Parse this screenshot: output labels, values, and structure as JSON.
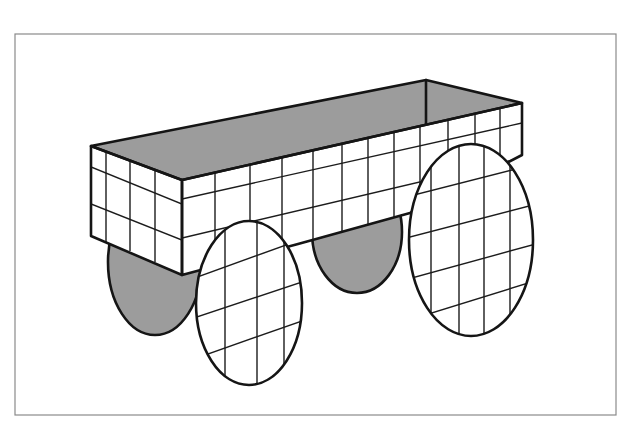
{
  "figure": {
    "canvas": {
      "width": 629,
      "height": 430
    },
    "frame": {
      "x": 15,
      "y": 34,
      "w": 601,
      "h": 381,
      "stroke": "#8a8a8a"
    },
    "colors": {
      "fill_gray": "#9c9c9c",
      "fill_white": "#ffffff",
      "line": "#151515"
    },
    "box": {
      "top_face": [
        [
          91,
          146
        ],
        [
          426,
          80
        ],
        [
          522,
          103
        ],
        [
          182,
          180
        ]
      ],
      "left_face": [
        [
          91,
          146
        ],
        [
          182,
          180
        ],
        [
          182,
          275
        ],
        [
          91,
          236
        ]
      ],
      "front_face": [
        [
          182,
          180
        ],
        [
          522,
          103
        ],
        [
          522,
          155
        ],
        [
          410,
          213
        ],
        [
          298,
          244
        ],
        [
          182,
          275
        ]
      ],
      "inner_back_edge": [
        [
          426,
          80
        ],
        [
          426,
          124
        ]
      ],
      "left_grid_verticals": [
        [
          106,
          152,
          106,
          242
        ],
        [
          130,
          161,
          130,
          251
        ],
        [
          155,
          170,
          155,
          262
        ]
      ],
      "left_grid_horizontals": [
        [
          91,
          167,
          182,
          204
        ],
        [
          91,
          204,
          182,
          240
        ]
      ],
      "front_grid_verticals": [
        215,
        250,
        282,
        313,
        342,
        368,
        394,
        420,
        448,
        475,
        500
      ],
      "front_grid_horizontals": [
        [
          182,
          199,
          522,
          123
        ],
        [
          182,
          238,
          522,
          158
        ]
      ]
    },
    "wheels": {
      "back_left": {
        "cx": 155,
        "cy": 262,
        "rx": 47,
        "ry": 73,
        "fill": "gray"
      },
      "back_right": {
        "cx": 357,
        "cy": 232,
        "rx": 45,
        "ry": 61,
        "fill": "gray"
      },
      "front_left": {
        "cx": 249,
        "cy": 303,
        "rx": 53,
        "ry": 82,
        "fill": "grid",
        "verticals": [
          225,
          257,
          284
        ],
        "diagonals": [
          [
            200,
            276,
            300,
            240
          ],
          [
            197,
            317,
            302,
            282
          ],
          [
            205,
            355,
            296,
            323
          ]
        ]
      },
      "front_right": {
        "cx": 471,
        "cy": 240,
        "rx": 62,
        "ry": 96,
        "fill": "grid",
        "verticals": [
          431,
          459,
          484,
          510
        ],
        "diagonals": [
          [
            414,
            195,
            528,
            166
          ],
          [
            410,
            237,
            533,
            205
          ],
          [
            412,
            278,
            532,
            245
          ],
          [
            425,
            315,
            522,
            285
          ]
        ]
      }
    }
  }
}
